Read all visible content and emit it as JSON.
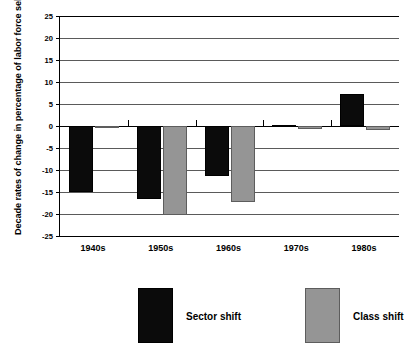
{
  "chart_data": {
    "type": "bar",
    "title": "",
    "xlabel": "",
    "ylabel": "Decade rates of change in percentage of labor force self-employed",
    "categories": [
      "1940s",
      "1950s",
      "1960s",
      "1970s",
      "1980s"
    ],
    "series": [
      {
        "name": "Sector shift",
        "color": "#0b0b0b",
        "values": [
          -15.0,
          -16.5,
          -11.3,
          0.3,
          7.3
        ]
      },
      {
        "name": "Class shift",
        "color": "#959595",
        "values": [
          -0.5,
          -20.2,
          -17.3,
          -0.7,
          -1.0
        ]
      }
    ],
    "ylim": [
      -25,
      25
    ],
    "yticks": [
      25,
      20,
      15,
      10,
      5,
      0,
      -5,
      -10,
      -15,
      -20,
      -25
    ],
    "ytick_labels": [
      "25",
      "20",
      "15",
      "10",
      "5",
      "0",
      "-5",
      "-10",
      "-15",
      "-20",
      "-25"
    ],
    "grid": true,
    "legend_position": "bottom"
  },
  "legend": {
    "entries": [
      {
        "label": "Sector shift",
        "color": "#0b0b0b"
      },
      {
        "label": "Class shift",
        "color": "#959595"
      }
    ]
  }
}
